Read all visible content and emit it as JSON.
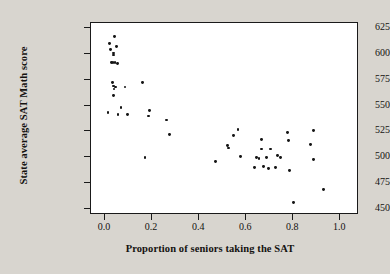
{
  "chart_data": {
    "type": "scatter",
    "title": "",
    "xlabel": "Proportion of seniors taking the SAT",
    "ylabel": "State average SAT Math score",
    "xlim": [
      -0.06,
      1.08
    ],
    "ylim": [
      444,
      630
    ],
    "grid": false,
    "legend": null,
    "xticks": [
      0.0,
      0.2,
      0.4,
      0.6,
      0.8,
      1.0
    ],
    "xtick_labels": [
      "0.0",
      "0.2",
      "0.4",
      "0.6",
      "0.8",
      "1.0"
    ],
    "yticks": [
      450,
      475,
      500,
      525,
      550,
      575,
      600,
      625
    ],
    "ytick_labels": [
      "450",
      "475",
      "500",
      "525",
      "550",
      "575",
      "600",
      "625"
    ],
    "marker": "filled-circle",
    "marker_color": "#151515",
    "point_count": 50,
    "points": [
      {
        "x": 0.04,
        "y": 617
      },
      {
        "x": 0.02,
        "y": 610
      },
      {
        "x": 0.05,
        "y": 607
      },
      {
        "x": 0.023,
        "y": 604
      },
      {
        "x": 0.035,
        "y": 601
      },
      {
        "x": 0.035,
        "y": 599
      },
      {
        "x": 0.027,
        "y": 592
      },
      {
        "x": 0.034,
        "y": 592
      },
      {
        "x": 0.042,
        "y": 592
      },
      {
        "x": 0.052,
        "y": 591
      },
      {
        "x": 0.032,
        "y": 572
      },
      {
        "x": 0.16,
        "y": 572
      },
      {
        "x": 0.036,
        "y": 569
      },
      {
        "x": 0.045,
        "y": 568
      },
      {
        "x": 0.085,
        "y": 568
      },
      {
        "x": 0.038,
        "y": 566
      },
      {
        "x": 0.036,
        "y": 560
      },
      {
        "x": 0.068,
        "y": 548
      },
      {
        "x": 0.19,
        "y": 545
      },
      {
        "x": 0.012,
        "y": 543
      },
      {
        "x": 0.055,
        "y": 541
      },
      {
        "x": 0.095,
        "y": 541
      },
      {
        "x": 0.185,
        "y": 540
      },
      {
        "x": 0.26,
        "y": 536
      },
      {
        "x": 0.275,
        "y": 522
      },
      {
        "x": 0.17,
        "y": 500
      },
      {
        "x": 0.47,
        "y": 496
      },
      {
        "x": 0.52,
        "y": 511
      },
      {
        "x": 0.525,
        "y": 509
      },
      {
        "x": 0.545,
        "y": 521
      },
      {
        "x": 0.565,
        "y": 527
      },
      {
        "x": 0.575,
        "y": 501
      },
      {
        "x": 0.635,
        "y": 490
      },
      {
        "x": 0.645,
        "y": 500
      },
      {
        "x": 0.655,
        "y": 499
      },
      {
        "x": 0.665,
        "y": 517
      },
      {
        "x": 0.665,
        "y": 508
      },
      {
        "x": 0.675,
        "y": 491
      },
      {
        "x": 0.685,
        "y": 500
      },
      {
        "x": 0.695,
        "y": 489
      },
      {
        "x": 0.705,
        "y": 508
      },
      {
        "x": 0.725,
        "y": 490
      },
      {
        "x": 0.735,
        "y": 502
      },
      {
        "x": 0.745,
        "y": 500
      },
      {
        "x": 0.775,
        "y": 524
      },
      {
        "x": 0.78,
        "y": 516
      },
      {
        "x": 0.785,
        "y": 487
      },
      {
        "x": 0.8,
        "y": 456
      },
      {
        "x": 0.875,
        "y": 512
      },
      {
        "x": 0.885,
        "y": 526
      },
      {
        "x": 0.885,
        "y": 498
      },
      {
        "x": 0.93,
        "y": 469
      }
    ]
  }
}
